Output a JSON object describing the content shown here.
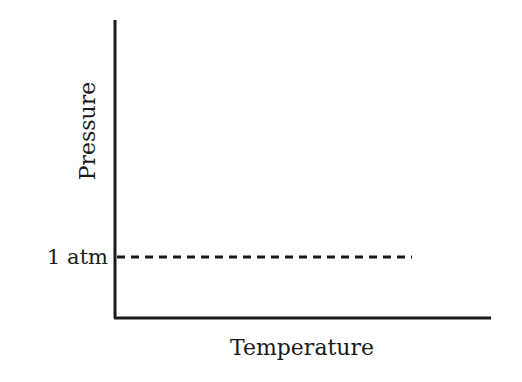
{
  "diagram": {
    "type": "pressure-temperature axes",
    "y_axis_label": "Pressure",
    "x_axis_label": "Temperature",
    "reference_line": {
      "label": "1 atm",
      "style": "dashed"
    },
    "colors": {
      "ink": "#1a1a1a",
      "background": "#ffffff"
    }
  }
}
